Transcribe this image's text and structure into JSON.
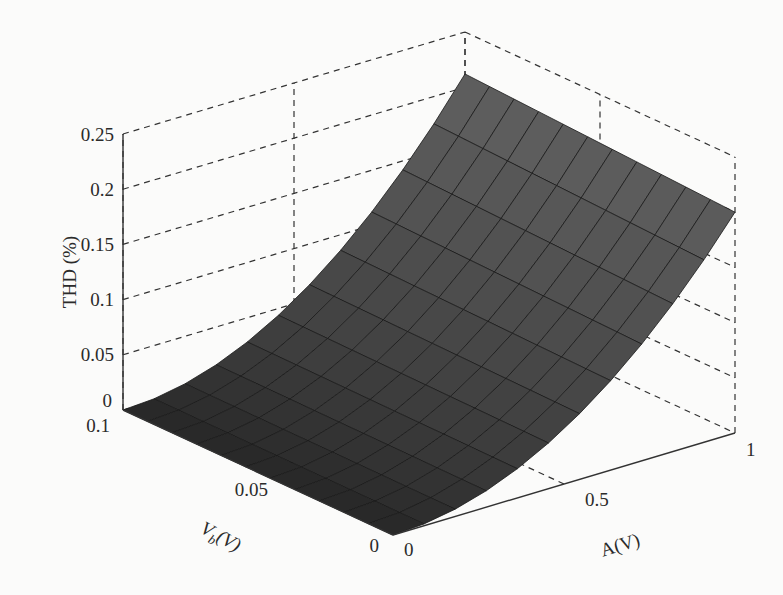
{
  "chart_data": {
    "type": "surface3d",
    "title": "",
    "zlabel": "THD (%)",
    "xlabel": "A(V)",
    "ylabel": "V_b(V)",
    "ylabel_parts": {
      "base": "V",
      "sub": "b",
      "rest": "(V)"
    },
    "x_range": [
      0,
      1
    ],
    "y_range": [
      0,
      0.1
    ],
    "z_range": [
      0,
      0.25
    ],
    "x_ticks": [
      "0",
      "0.5",
      "1"
    ],
    "y_ticks": [
      "0",
      "0.05",
      "0.1"
    ],
    "z_ticks": [
      "0",
      "0.05",
      "0.1",
      "0.15",
      "0.2",
      "0.25"
    ],
    "grid": true,
    "grid_style": "dashed",
    "surface_color": "#4a4a4a",
    "mesh_resolution": 11,
    "surface_description": "THD increases roughly quadratically with A, nearly independent of Vb; ~0 at A=0, ~0.2 at A=1",
    "sample_points": [
      {
        "A": 0.0,
        "Vb": 0.0,
        "THD": 0.0
      },
      {
        "A": 0.5,
        "Vb": 0.0,
        "THD": 0.05
      },
      {
        "A": 1.0,
        "Vb": 0.0,
        "THD": 0.2
      },
      {
        "A": 0.0,
        "Vb": 0.1,
        "THD": 0.0
      },
      {
        "A": 0.5,
        "Vb": 0.1,
        "THD": 0.055
      },
      {
        "A": 1.0,
        "Vb": 0.1,
        "THD": 0.21
      }
    ]
  }
}
